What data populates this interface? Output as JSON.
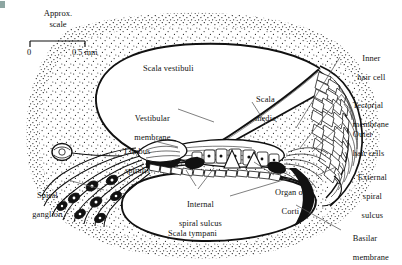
{
  "figure": {
    "background_color": "#ffffff",
    "ink_color": "#111111",
    "width": 402,
    "height": 265
  },
  "scale_bar": {
    "caption_line1": "Approx.",
    "caption_line2": "scale",
    "left_tick_label": "0",
    "right_tick_label": "0.5 mm"
  },
  "labels": [
    {
      "id": "scala-vestibuli",
      "text": "Scala vestibuli",
      "lines": [
        "Scala vestibuli"
      ],
      "x": 143,
      "y": 64,
      "align": "left"
    },
    {
      "id": "scala-media",
      "text": "Scala media",
      "lines": [
        "Scala",
        "media"
      ],
      "x": 237,
      "y": 85,
      "align": "left"
    },
    {
      "id": "vestibular-membrane",
      "text": "Vestibular membrane",
      "lines": [
        "Vestibular",
        "membrane"
      ],
      "x": 118,
      "y": 104,
      "align": "left"
    },
    {
      "id": "limbus-spiralis",
      "text": "Limbus spiralis",
      "lines": [
        "Limbus",
        "spiralis"
      ],
      "x": 112,
      "y": 137,
      "align": "left"
    },
    {
      "id": "spiral-ganglion",
      "text": "Spiral ganglion",
      "lines": [
        "Spiral",
        "ganglion"
      ],
      "x": 22,
      "y": 181,
      "align": "left"
    },
    {
      "id": "internal-spiral-sulcus",
      "text": "Internal spiral sulcus",
      "lines": [
        "Internal",
        "spiral sulcus"
      ],
      "x": 192,
      "y": 196,
      "align": "center"
    },
    {
      "id": "scala-tympani",
      "text": "Scala tympani",
      "lines": [
        "Scala tympani"
      ],
      "x": 168,
      "y": 229,
      "align": "left"
    },
    {
      "id": "organ-of-corti",
      "text": "Organ of Corti",
      "lines": [
        "Organ of",
        "Corti"
      ],
      "x": 286,
      "y": 178,
      "align": "center"
    },
    {
      "id": "inner-hair-cell",
      "text": "Inner hair cell",
      "lines": [
        "Inner",
        "hair cell"
      ],
      "x": 366,
      "y": 44,
      "align": "center"
    },
    {
      "id": "tectorial-membrane",
      "text": "Tectorial membrane",
      "lines": [
        "Tectorial",
        "membrane"
      ],
      "x": 344,
      "y": 91,
      "align": "left"
    },
    {
      "id": "outer-hair-cells",
      "text": "Outer hair cells",
      "lines": [
        "Outer",
        "hair cells"
      ],
      "x": 344,
      "y": 120,
      "align": "left"
    },
    {
      "id": "external-spiral-sulcus",
      "text": "External spiral sulcus",
      "lines": [
        "External",
        "spiral",
        "sulcus"
      ],
      "x": 366,
      "y": 165,
      "align": "center"
    },
    {
      "id": "basilar-membrane",
      "text": "Basilar membrane",
      "lines": [
        "Basilar",
        "membrane"
      ],
      "x": 344,
      "y": 228,
      "align": "left"
    }
  ],
  "structures": [
    {
      "id": "scala-vestibuli-chamber",
      "name": "Scala vestibuli chamber"
    },
    {
      "id": "scala-media-chamber",
      "name": "Scala media (cochlear duct)"
    },
    {
      "id": "scala-tympani-chamber",
      "name": "Scala tympani chamber"
    },
    {
      "id": "vestibular-membrane-line",
      "name": "Reissner's (vestibular) membrane"
    },
    {
      "id": "basilar-membrane-line",
      "name": "Basilar membrane"
    },
    {
      "id": "stria-vascularis",
      "name": "Stria vascularis / lateral wall"
    },
    {
      "id": "spiral-ganglion-cells",
      "name": "Spiral ganglion neurons"
    },
    {
      "id": "nerve-fibre-bundle",
      "name": "Cochlear nerve fibre bundle"
    },
    {
      "id": "bone-stipple",
      "name": "Surrounding bone (stippled)"
    }
  ]
}
